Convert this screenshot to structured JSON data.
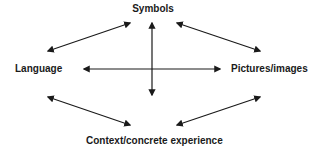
{
  "diagram": {
    "nodes": {
      "top": {
        "label": "Symbols"
      },
      "left": {
        "label": "Language"
      },
      "right": {
        "label": "Pictures/images"
      },
      "bottom": {
        "label": "Context/concrete experience"
      }
    },
    "edges": [
      {
        "from": "Language",
        "to": "Symbols",
        "type": "bidirectional"
      },
      {
        "from": "Symbols",
        "to": "Pictures/images",
        "type": "bidirectional"
      },
      {
        "from": "Language",
        "to": "Context/concrete experience",
        "type": "bidirectional"
      },
      {
        "from": "Context/concrete experience",
        "to": "Pictures/images",
        "type": "bidirectional"
      },
      {
        "from": "Language",
        "to": "Pictures/images",
        "type": "bidirectional"
      },
      {
        "from": "Symbols",
        "to": "Context/concrete experience",
        "type": "bidirectional"
      }
    ],
    "colors": {
      "line": "#1a1a1a",
      "text": "#1a1a1a",
      "background": "#ffffff"
    }
  }
}
